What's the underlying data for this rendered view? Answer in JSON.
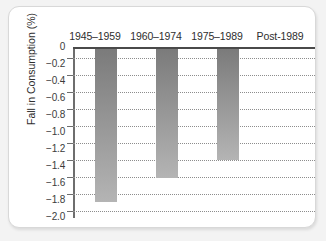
{
  "chart_data": {
    "type": "bar",
    "title": "",
    "subtitle": "",
    "xlabel": "",
    "ylabel": "Fall in Consumption (%)",
    "categories": [
      "1945–1959",
      "1960–1974",
      "1975–1989",
      "Post-1989"
    ],
    "values": [
      -1.82,
      -1.54,
      -1.33,
      0
    ],
    "series": [
      {
        "name": "Fall in Consumption (%)",
        "values": [
          -1.82,
          -1.54,
          -1.33,
          0
        ]
      }
    ],
    "ylim": [
      -2.0,
      0
    ],
    "ytick_labels": [
      "0",
      "−0.2",
      "−0.4",
      "−0.6",
      "−0.8",
      "−1.0",
      "−1.2",
      "−1.4",
      "−1.6",
      "−1.8",
      "−2.0"
    ],
    "ytick_values": [
      0,
      -0.2,
      -0.4,
      -0.6,
      -0.8,
      -1.0,
      -1.2,
      -1.4,
      -1.6,
      -1.8,
      -2.0
    ],
    "grid": true,
    "grid_style": "dotted-horizontal",
    "legend": false,
    "legend_position": "none",
    "bar_colors": [
      "#8c8c8c",
      "#9a9a9a",
      "#9a9a9a",
      "#ffffff"
    ],
    "bar_gradient_top": "#7a7a7a",
    "bar_gradient_bottom": "#b4b4b4",
    "axis_color": "#4a4a4a",
    "gridline_color": "#8d8d8d",
    "background_color": "#ffffff",
    "page_background_color": "#f3f3f3",
    "category_label_position": "top"
  }
}
